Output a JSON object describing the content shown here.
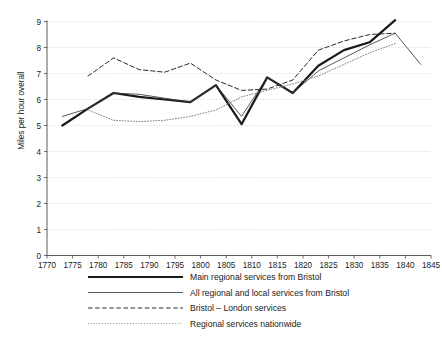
{
  "chart_data": {
    "type": "line",
    "title": "",
    "xlabel": "",
    "ylabel": "Miles per hour overall",
    "xlim": [
      1770,
      1845
    ],
    "ylim": [
      0,
      9
    ],
    "xticks": [
      1770,
      1775,
      1780,
      1785,
      1790,
      1795,
      1800,
      1805,
      1810,
      1815,
      1820,
      1825,
      1830,
      1835,
      1840,
      1845
    ],
    "yticks": [
      0,
      1,
      2,
      3,
      4,
      5,
      6,
      7,
      8,
      9
    ],
    "grid": true,
    "legend_position": "below",
    "series": [
      {
        "name": "Main regional services from Bristol",
        "style": "thick-solid",
        "color": "#1a1a1a",
        "x": [
          1773,
          1778,
          1783,
          1788,
          1793,
          1798,
          1803,
          1808,
          1813,
          1818,
          1823,
          1828,
          1833,
          1838
        ],
        "values": [
          5.0,
          5.65,
          6.25,
          6.1,
          6.0,
          5.9,
          6.55,
          5.05,
          6.85,
          6.25,
          7.3,
          7.9,
          8.2,
          9.05
        ]
      },
      {
        "name": "All regional and local services from Bristol",
        "style": "thin-solid",
        "color": "#3a3a3a",
        "x": [
          1773,
          1778,
          1783,
          1788,
          1793,
          1798,
          1803,
          1808,
          1813,
          1818,
          1823,
          1828,
          1833,
          1838,
          1843
        ],
        "values": [
          5.35,
          5.65,
          6.25,
          6.2,
          6.05,
          5.9,
          6.55,
          5.35,
          6.85,
          6.25,
          7.1,
          7.6,
          8.1,
          8.55,
          7.35
        ]
      },
      {
        "name": "Bristol – London services",
        "style": "dashed",
        "color": "#2a2a2a",
        "x": [
          1778,
          1783,
          1788,
          1793,
          1798,
          1803,
          1808,
          1813,
          1818,
          1823,
          1828,
          1833,
          1838
        ],
        "values": [
          6.9,
          7.6,
          7.15,
          7.05,
          7.4,
          6.75,
          6.35,
          6.4,
          6.75,
          7.9,
          8.25,
          8.5,
          8.55
        ]
      },
      {
        "name": "Regional services nationwide",
        "style": "dotted",
        "color": "#808080",
        "x": [
          1778,
          1783,
          1788,
          1793,
          1798,
          1803,
          1808,
          1813,
          1818,
          1823,
          1828,
          1833,
          1838
        ],
        "values": [
          5.6,
          5.2,
          5.15,
          5.2,
          5.35,
          5.6,
          6.1,
          6.35,
          6.6,
          6.9,
          7.35,
          7.8,
          8.15
        ]
      }
    ]
  },
  "legend": {
    "items": [
      {
        "label": "Main regional services from Bristol",
        "style": "thick-solid"
      },
      {
        "label": "All regional and local services from Bristol",
        "style": "thin-solid"
      },
      {
        "label": "Bristol – London services",
        "style": "dashed"
      },
      {
        "label": "Regional services nationwide",
        "style": "dotted"
      }
    ]
  }
}
